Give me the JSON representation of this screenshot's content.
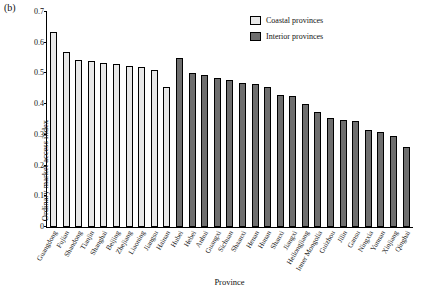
{
  "panel_label": "(b)",
  "legend": {
    "coastal": "Coastal provinces",
    "interior": "Interior provinces",
    "coastal_color": "#e8e8e8",
    "interior_color": "#6e6e6e"
  },
  "chart_data": {
    "type": "bar",
    "title": "",
    "xlabel": "Province",
    "ylabel": "Ordinary market access index",
    "ylim": [
      0,
      0.7
    ],
    "yticks": [
      "0",
      "0.1",
      "0.2",
      "0.3",
      "0.4",
      "0.5",
      "0.6",
      "0.7"
    ],
    "grid": false,
    "legend_position": "top-right",
    "categories": [
      "Guangdong",
      "Fujian",
      "Shandong",
      "Tianjin",
      "Shanghai",
      "Beijing",
      "Zhejiang",
      "Liaoning",
      "Jiangsu",
      "Hainan",
      "Hubei",
      "Hebei",
      "Anhui",
      "Guangxi",
      "Sichuan",
      "Shaanxi",
      "Henan",
      "Hunan",
      "Shanxi",
      "Jiangxi",
      "Heilongjiang",
      "Inner Mongolia",
      "Guizhou",
      "Jilin",
      "Gansu",
      "Ningxia",
      "Yunnan",
      "Xinjiang",
      "Qinghai"
    ],
    "values": [
      0.635,
      0.57,
      0.545,
      0.54,
      0.535,
      0.53,
      0.525,
      0.52,
      0.51,
      0.455,
      0.55,
      0.5,
      0.495,
      0.485,
      0.48,
      0.47,
      0.465,
      0.455,
      0.43,
      0.425,
      0.4,
      0.375,
      0.355,
      0.35,
      0.345,
      0.315,
      0.31,
      0.295,
      0.26
    ],
    "groups": [
      "coastal",
      "coastal",
      "coastal",
      "coastal",
      "coastal",
      "coastal",
      "coastal",
      "coastal",
      "coastal",
      "coastal",
      "interior",
      "interior",
      "interior",
      "interior",
      "interior",
      "interior",
      "interior",
      "interior",
      "interior",
      "interior",
      "interior",
      "interior",
      "interior",
      "interior",
      "interior",
      "interior",
      "interior",
      "interior",
      "interior"
    ]
  }
}
